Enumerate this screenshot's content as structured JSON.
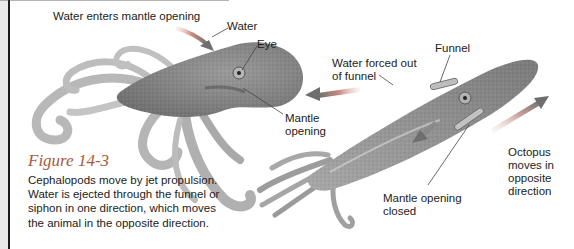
{
  "figure": {
    "number": "Figure 14-3",
    "caption": "Cephalopods move by jet propulsion. Water is ejected through the funnel or siphon in one direction, which moves the animal in the opposite direction."
  },
  "labels": {
    "water_enters": "Water enters mantle opening",
    "water": "Water",
    "eye": "Eye",
    "mantle_opening_line1": "Mantle",
    "mantle_opening_line2": "opening",
    "water_forced_line1": "Water forced out",
    "water_forced_line2": "of funnel",
    "funnel": "Funnel",
    "mantle_closed_line1": "Mantle opening",
    "mantle_closed_line2": "closed",
    "octopus_moves_line1": "Octopus",
    "octopus_moves_line2": "moves in",
    "octopus_moves_line3": "opposite",
    "octopus_moves_line4": "direction"
  },
  "colors": {
    "figure_title": "#a85a3a",
    "arrow_head": "#6e6e6e",
    "arrow_tail": "#c98a80",
    "body_fill": "#8a8a8a",
    "tentacle_fill": "#b9b9b9"
  },
  "icons": {
    "water_in_arrow": "arrow-right-icon",
    "water_out_arrow": "arrow-left-icon",
    "movement_arrow": "arrow-up-right-icon",
    "down_arrow": "arrow-down-left-icon"
  }
}
